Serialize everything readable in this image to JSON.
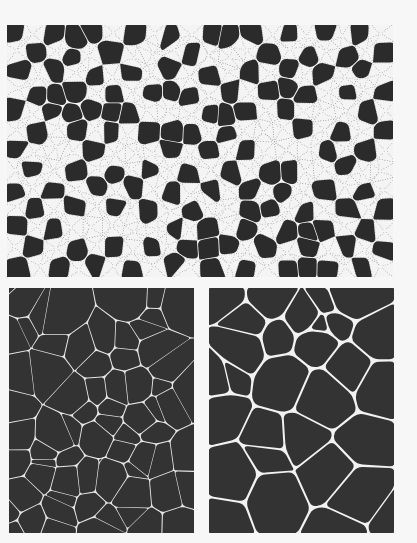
{
  "figure": {
    "background_color": "#f7f7f7",
    "panels": [
      {
        "id": "top",
        "description": "two-phase cellular pattern: dark polygonal cells alternating with light dotted regions",
        "dark_color": "#2b2b2b",
        "light_color": "#f4f4f4",
        "dot_color": "#8a8a8a",
        "grid_cols": 20,
        "grid_rows": 13,
        "seed": 7
      },
      {
        "id": "bottom-left",
        "description": "dry foam with thin light films, polydisperse cells including small cells",
        "cell_color": "#333333",
        "film_color": "#e6e6e6",
        "film_width": 1.2,
        "cell_count": 70,
        "seed": 11
      },
      {
        "id": "bottom-right",
        "description": "foam with thicker light films and Plateau borders, larger rounded cells",
        "cell_color": "#333333",
        "film_color": "#f2f2f2",
        "film_width": 2.6,
        "cell_count": 30,
        "seed": 23
      }
    ]
  }
}
